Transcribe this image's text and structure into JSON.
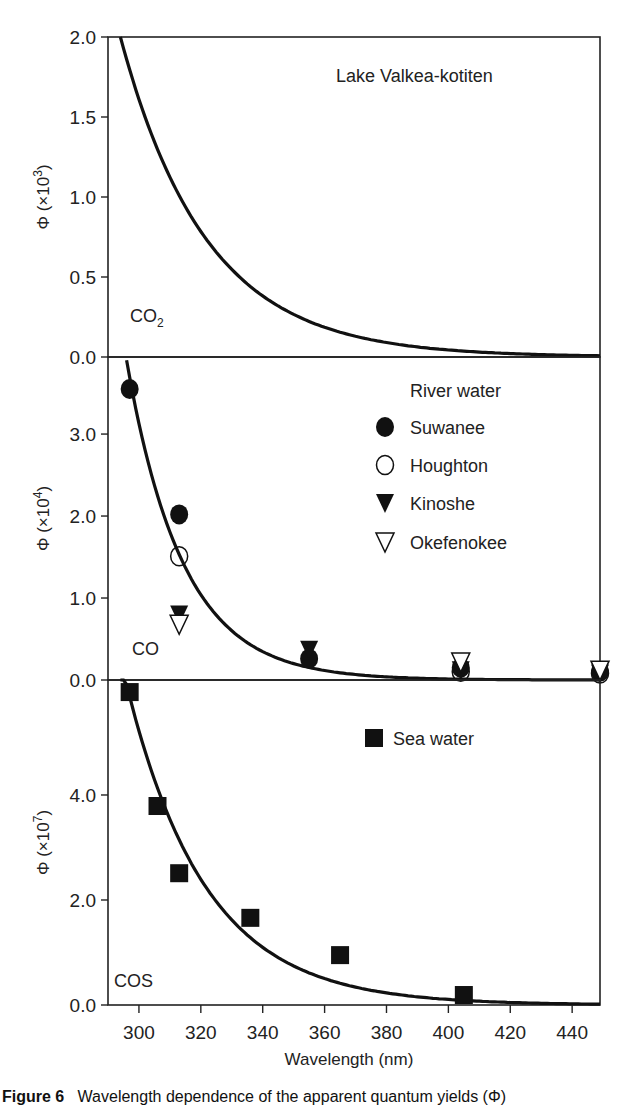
{
  "chart_data": [
    {
      "type": "line+scatter",
      "panel": "top",
      "title": "Lake Valkea-kotiten",
      "species_label": "CO",
      "species_subscript": "2",
      "ylabel": "Φ (×10³)",
      "ylabel_main": "Φ (×10",
      "ylabel_exp": "3",
      "ylim": [
        0,
        2.0
      ],
      "yticks": [
        0.0,
        0.5,
        1.0,
        1.5,
        2.0
      ],
      "ytick_labels": [
        "0.0",
        "0.5",
        "1.0",
        "1.5",
        "2.0"
      ],
      "fit_curve": {
        "form": "A*exp(-k*(x-x0))",
        "A": 2.0,
        "k": 0.036,
        "x0": 294,
        "x_range": [
          294,
          449
        ]
      },
      "series": []
    },
    {
      "type": "line+scatter",
      "panel": "middle",
      "species_label": "CO",
      "ylabel": "Φ (×10⁴)",
      "ylabel_main": "Φ (×10",
      "ylabel_exp": "4",
      "ylim": [
        0,
        3.94
      ],
      "yticks": [
        0.0,
        1.0,
        2.0,
        3.0
      ],
      "ytick_labels": [
        "0.0",
        "1.0",
        "2.0",
        "3.0"
      ],
      "legend_title": "River water",
      "legend_position": "top-right",
      "fit_curve": {
        "form": "A*exp(-k*(x-x0))",
        "A": 3.9,
        "k": 0.055,
        "x0": 296,
        "x_range": [
          296,
          449
        ]
      },
      "series": [
        {
          "name": "Suwanee",
          "marker": "filled-circle",
          "x": [
            297,
            313,
            355,
            404,
            449
          ],
          "y": [
            3.55,
            2.02,
            0.26,
            0.15,
            0.1
          ]
        },
        {
          "name": "Houghton",
          "marker": "open-circle",
          "x": [
            313,
            404,
            449
          ],
          "y": [
            1.51,
            0.1,
            0.08
          ]
        },
        {
          "name": "Kinoshe",
          "marker": "filled-triangle-down",
          "x": [
            313,
            355,
            404,
            449
          ],
          "y": [
            0.8,
            0.37,
            0.12,
            0.08
          ]
        },
        {
          "name": "Okefenokee",
          "marker": "open-triangle-down",
          "x": [
            313,
            404,
            449
          ],
          "y": [
            0.68,
            0.22,
            0.12
          ]
        }
      ]
    },
    {
      "type": "line+scatter",
      "panel": "bottom",
      "species_label": "COS",
      "ylabel": "Φ (×10⁷)",
      "ylabel_main": "Φ (×10",
      "ylabel_exp": "7",
      "ylim": [
        0,
        6.19
      ],
      "yticks": [
        0.0,
        2.0,
        4.0
      ],
      "ytick_labels": [
        "0.0",
        "2.0",
        "4.0"
      ],
      "legend_position": "top-right",
      "xlabel": "Wavelength (nm)",
      "xlim": [
        290,
        449
      ],
      "xticks": [
        300,
        320,
        340,
        360,
        380,
        400,
        420,
        440
      ],
      "xtick_labels": [
        "300",
        "320",
        "340",
        "360",
        "380",
        "400",
        "420",
        "440"
      ],
      "fit_curve": {
        "form": "A*exp(-k*(x-x0))",
        "A": 6.6,
        "k": 0.039,
        "x0": 294,
        "x_range": [
          294,
          449
        ]
      },
      "series": [
        {
          "name": "Sea water",
          "marker": "filled-square",
          "x": [
            297,
            306,
            313,
            336,
            365,
            405
          ],
          "y": [
            5.96,
            3.79,
            2.51,
            1.66,
            0.95,
            0.19
          ]
        }
      ]
    }
  ],
  "caption": {
    "label": "Figure 6",
    "text": "Wavelength dependence of the apparent quantum yields (Φ)"
  }
}
